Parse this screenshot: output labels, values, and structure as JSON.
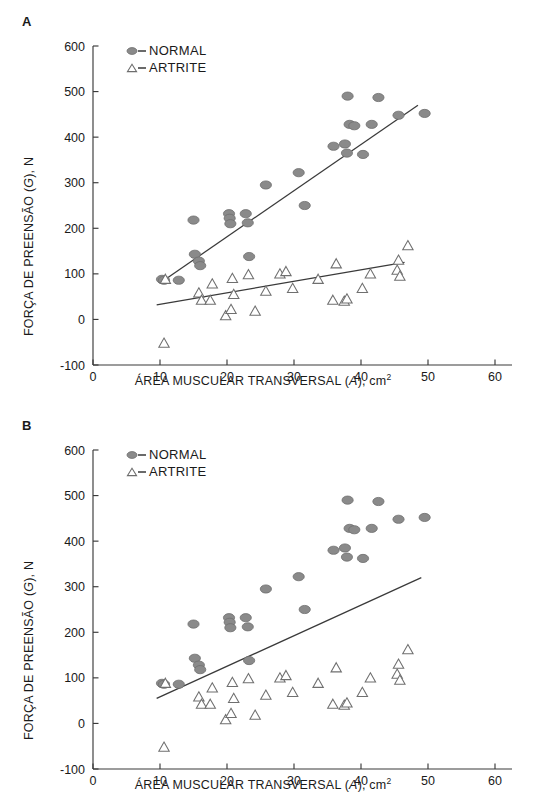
{
  "figure": {
    "panels": [
      {
        "letter": "A",
        "ylabel_main": "FORÇA DE PREENSÃO (",
        "ylabel_var": "G",
        "ylabel_tail": "), N",
        "xlabel_main": "ÁREA MUSCULAR TRANSVERSAL (",
        "xlabel_var": "A",
        "xlabel_tail": "), cm",
        "xlabel_sup": "2",
        "legend": [
          {
            "marker": "filled-circle-marker",
            "label": "NORMAL"
          },
          {
            "marker": "open-triangle-marker",
            "label": "ARTRITE"
          }
        ]
      },
      {
        "letter": "B",
        "ylabel_main": "FORÇA DE PREENSÃO (",
        "ylabel_var": "G",
        "ylabel_tail": "), N",
        "xlabel_main": "ÁREA MUSCULAR TRANSVERSAL (",
        "xlabel_var": "A",
        "xlabel_tail": "), cm",
        "xlabel_sup": "2",
        "legend": [
          {
            "marker": "filled-circle-marker",
            "label": "NORMAL"
          },
          {
            "marker": "open-triangle-marker",
            "label": "ARTRITE"
          }
        ]
      }
    ]
  },
  "chart_data": [
    {
      "panel": "A",
      "type": "scatter",
      "title": "",
      "xlabel": "ÁREA MUSCULAR TRANSVERSAL (A), cm2",
      "ylabel": "FORÇA DE PREENSÃO (G), N",
      "xlim": [
        0,
        60
      ],
      "ylim": [
        -100,
        600
      ],
      "xticks": [
        0,
        10,
        20,
        30,
        40,
        50,
        60
      ],
      "yticks": [
        -100,
        0,
        100,
        200,
        300,
        400,
        500,
        600
      ],
      "grid": false,
      "legend_position": "top-left-inside",
      "series": [
        {
          "name": "NORMAL",
          "marker": "filled-circle",
          "color": "#8a8a8a",
          "points": [
            [
              10.3,
              88
            ],
            [
              10.6,
              86
            ],
            [
              12.8,
              86
            ],
            [
              15.2,
              143
            ],
            [
              15.8,
              128
            ],
            [
              16.0,
              118
            ],
            [
              15.0,
              218
            ],
            [
              20.3,
              232
            ],
            [
              20.4,
              222
            ],
            [
              20.5,
              210
            ],
            [
              22.8,
              232
            ],
            [
              23.1,
              212
            ],
            [
              23.3,
              138
            ],
            [
              25.8,
              295
            ],
            [
              30.7,
              322
            ],
            [
              31.6,
              250
            ],
            [
              35.9,
              380
            ],
            [
              37.6,
              385
            ],
            [
              37.9,
              365
            ],
            [
              38.0,
              490
            ],
            [
              38.3,
              428
            ],
            [
              39.0,
              425
            ],
            [
              40.3,
              362
            ],
            [
              41.6,
              428
            ],
            [
              42.6,
              487
            ],
            [
              45.6,
              448
            ],
            [
              49.5,
              452
            ]
          ]
        },
        {
          "name": "ARTRITE",
          "marker": "open-triangle",
          "color": "#8a8a8a",
          "points": [
            [
              10.6,
              -52
            ],
            [
              10.8,
              88
            ],
            [
              15.8,
              58
            ],
            [
              16.2,
              42
            ],
            [
              17.5,
              42
            ],
            [
              17.8,
              78
            ],
            [
              19.8,
              8
            ],
            [
              20.6,
              22
            ],
            [
              20.8,
              90
            ],
            [
              21.0,
              55
            ],
            [
              23.2,
              98
            ],
            [
              24.2,
              18
            ],
            [
              25.8,
              62
            ],
            [
              27.9,
              100
            ],
            [
              28.8,
              105
            ],
            [
              29.8,
              68
            ],
            [
              33.6,
              88
            ],
            [
              35.8,
              42
            ],
            [
              36.3,
              122
            ],
            [
              37.5,
              40
            ],
            [
              37.9,
              45
            ],
            [
              40.2,
              68
            ],
            [
              41.4,
              100
            ],
            [
              45.4,
              108
            ],
            [
              45.6,
              130
            ],
            [
              45.8,
              95
            ],
            [
              47.0,
              162
            ]
          ]
        }
      ],
      "fit_lines": [
        {
          "name": "NORMAL-fit",
          "x0": 10.0,
          "y0": 80,
          "x1": 48.5,
          "y1": 470
        },
        {
          "name": "ARTRITE-fit",
          "x0": 9.5,
          "y0": 32,
          "x1": 46.5,
          "y1": 125
        }
      ]
    },
    {
      "panel": "B",
      "type": "scatter",
      "title": "",
      "xlabel": "ÁREA MUSCULAR TRANSVERSAL (A), cm2",
      "ylabel": "FORÇA DE PREENSÃO (G), N",
      "xlim": [
        0,
        60
      ],
      "ylim": [
        -100,
        600
      ],
      "xticks": [
        0,
        10,
        20,
        30,
        40,
        50,
        60
      ],
      "yticks": [
        -100,
        0,
        100,
        200,
        300,
        400,
        500,
        600
      ],
      "grid": false,
      "legend_position": "top-left-inside",
      "series": [
        {
          "name": "NORMAL",
          "marker": "filled-circle",
          "color": "#8a8a8a",
          "points": [
            [
              10.3,
              88
            ],
            [
              10.6,
              86
            ],
            [
              12.8,
              86
            ],
            [
              15.2,
              143
            ],
            [
              15.8,
              128
            ],
            [
              16.0,
              118
            ],
            [
              15.0,
              218
            ],
            [
              20.3,
              232
            ],
            [
              20.4,
              222
            ],
            [
              20.5,
              210
            ],
            [
              22.8,
              232
            ],
            [
              23.1,
              212
            ],
            [
              23.3,
              138
            ],
            [
              25.8,
              295
            ],
            [
              30.7,
              322
            ],
            [
              31.6,
              250
            ],
            [
              35.9,
              380
            ],
            [
              37.6,
              385
            ],
            [
              37.9,
              365
            ],
            [
              38.0,
              490
            ],
            [
              38.3,
              428
            ],
            [
              39.0,
              425
            ],
            [
              40.3,
              362
            ],
            [
              41.6,
              428
            ],
            [
              42.6,
              487
            ],
            [
              45.6,
              448
            ],
            [
              49.5,
              452
            ]
          ]
        },
        {
          "name": "ARTRITE",
          "marker": "open-triangle",
          "color": "#8a8a8a",
          "points": [
            [
              10.6,
              -52
            ],
            [
              10.8,
              88
            ],
            [
              15.8,
              58
            ],
            [
              16.2,
              42
            ],
            [
              17.5,
              42
            ],
            [
              17.8,
              78
            ],
            [
              19.8,
              8
            ],
            [
              20.6,
              22
            ],
            [
              20.8,
              90
            ],
            [
              21.0,
              55
            ],
            [
              23.2,
              98
            ],
            [
              24.2,
              18
            ],
            [
              25.8,
              62
            ],
            [
              27.9,
              100
            ],
            [
              28.8,
              105
            ],
            [
              29.8,
              68
            ],
            [
              33.6,
              88
            ],
            [
              35.8,
              42
            ],
            [
              36.3,
              122
            ],
            [
              37.5,
              40
            ],
            [
              37.9,
              45
            ],
            [
              40.2,
              68
            ],
            [
              41.4,
              100
            ],
            [
              45.4,
              108
            ],
            [
              45.6,
              130
            ],
            [
              45.8,
              95
            ],
            [
              47.0,
              162
            ]
          ]
        }
      ],
      "fit_lines": [
        {
          "name": "combined-fit",
          "x0": 9.5,
          "y0": 55,
          "x1": 49.0,
          "y1": 320
        }
      ]
    }
  ]
}
